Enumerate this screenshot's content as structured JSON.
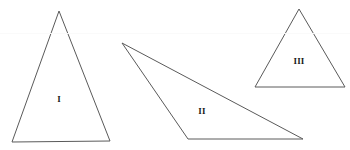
{
  "figure": {
    "background_color": "#ffffff",
    "stroke_color": "#5a5a5a",
    "label_color": "#1a1a1a",
    "width": 350,
    "height": 150,
    "shapes": [
      {
        "id": "triangle-1",
        "label": "I",
        "kind": "triangle",
        "points": "59,11 110,141 12,142",
        "label_x": 59,
        "label_y": 100,
        "description": "tall narrow acute triangle, apex up"
      },
      {
        "id": "triangle-2",
        "label": "II",
        "kind": "triangle",
        "points": "122,43 303,139 188,139",
        "label_x": 202,
        "label_y": 112,
        "description": "wide obtuse triangle, long thin wedge pointing left"
      },
      {
        "id": "triangle-3",
        "label": "III",
        "kind": "triangle",
        "points": "299,9 345,87 255,87",
        "label_x": 299,
        "label_y": 62,
        "description": "small triangle, apex up"
      }
    ],
    "artifacts": [
      {
        "id": "scan-line",
        "y": 33
      }
    ]
  }
}
